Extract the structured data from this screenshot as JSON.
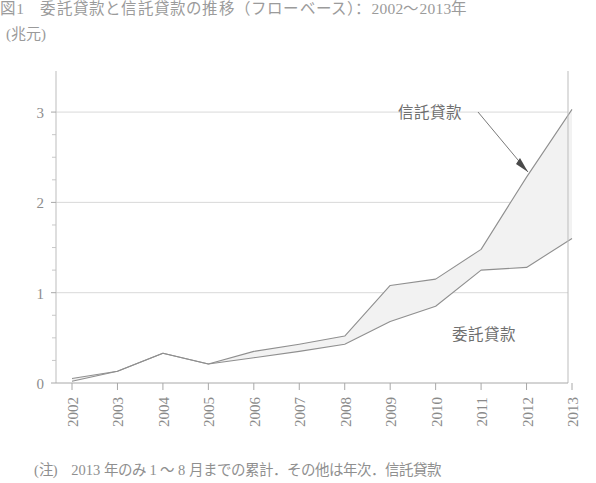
{
  "title": "図1　委託貸款と信託貸款の推移（フローベース）：2002～2013年",
  "y_unit": "(兆元)",
  "footnote": {
    "marker": "(注)",
    "text": "2013 年のみ 1 ～ 8 月までの累計．その他は年次．信託貸款"
  },
  "annotations": {
    "upper_series_label": "信託貸款",
    "lower_series_label": "委託貸款"
  },
  "chart_data": {
    "type": "area",
    "title": "図1　委託貸款と信託貸款の推移（フローベース）：2002～2013年",
    "xlabel": "",
    "ylabel": "(兆元)",
    "categories": [
      "2002",
      "2003",
      "2004",
      "2005",
      "2006",
      "2007",
      "2008",
      "2009",
      "2010",
      "2011",
      "2012",
      "2013"
    ],
    "x_tick_labels": [
      "2002",
      "2003",
      "2004",
      "2005",
      "2006",
      "2007",
      "2008",
      "2009",
      "2010",
      "2011",
      "2012",
      "2013"
    ],
    "y_tick_labels": [
      "0",
      "1",
      "2",
      "3"
    ],
    "y_ticks": [
      0,
      1,
      2,
      3
    ],
    "y_minor_ticks": [
      0.25,
      0.5,
      0.75,
      1.25,
      1.5,
      1.75,
      2.25,
      2.5,
      2.75
    ],
    "ylim": [
      0,
      3.3
    ],
    "grid": "horizontal-major",
    "legend_position": "inline-annotation",
    "series": [
      {
        "name": "信託貸款",
        "role": "upper-boundary",
        "color": "#8f8f8f",
        "values": [
          0.05,
          0.13,
          0.33,
          0.21,
          0.35,
          0.43,
          0.52,
          1.08,
          1.15,
          1.48,
          2.28,
          3.03
        ]
      },
      {
        "name": "委託貸款",
        "role": "lower-boundary",
        "color": "#8f8f8f",
        "values": [
          0.02,
          0.13,
          0.33,
          0.21,
          0.28,
          0.35,
          0.43,
          0.68,
          0.85,
          1.25,
          1.28,
          1.6
        ]
      }
    ],
    "band_fill": "#f2f2f2"
  }
}
